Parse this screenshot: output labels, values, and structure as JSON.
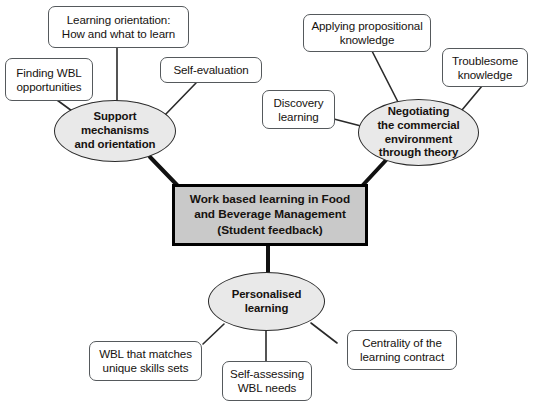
{
  "figure": {
    "type": "concept-map",
    "title_cropped_top": "",
    "background_color": "#ffffff",
    "hub_fill": "#c9c9c9",
    "hub_border": "#000000",
    "ellipse_fill": "#e9e9e9",
    "ellipse_border": "#2a2a2a",
    "leaf_fill": "#ffffff",
    "leaf_border": "#55595c",
    "text_color": "#16120f"
  },
  "hub": {
    "line1": "Work based learning in Food",
    "line2": "and Beverage Management",
    "line3": "(Student feedback)"
  },
  "branches": [
    {
      "id": "support",
      "title_line1": "Support",
      "title_line2": "mechanisms",
      "title_line3": "and orientation",
      "leaves": [
        {
          "id": "finding-wbl",
          "line1": "Finding WBL",
          "line2": "opportunities"
        },
        {
          "id": "learning-orientation",
          "line1": "Learning orientation:",
          "line2": "How and what to learn"
        },
        {
          "id": "self-evaluation",
          "line1": "Self-evaluation",
          "line2": ""
        }
      ]
    },
    {
      "id": "negotiating",
      "title_line1": "Negotiating",
      "title_line2": "the commercial",
      "title_line3": "environment",
      "title_line4": "through theory",
      "leaves": [
        {
          "id": "discovery-learning",
          "line1": "Discovery",
          "line2": "learning"
        },
        {
          "id": "applying-propositional",
          "line1": "Applying propositional",
          "line2": "knowledge"
        },
        {
          "id": "troublesome-knowledge",
          "line1": "Troublesome",
          "line2": "knowledge"
        }
      ]
    },
    {
      "id": "personalised",
      "title_line1": "Personalised",
      "title_line2": "learning",
      "leaves": [
        {
          "id": "wbl-matches-skills",
          "line1": "WBL that matches",
          "line2": "unique skills sets"
        },
        {
          "id": "self-assessing-wbl",
          "line1": "Self-assessing",
          "line2": "WBL needs"
        },
        {
          "id": "centrality-contract",
          "line1": "Centrality of the",
          "line2": "learning contract"
        }
      ]
    }
  ]
}
